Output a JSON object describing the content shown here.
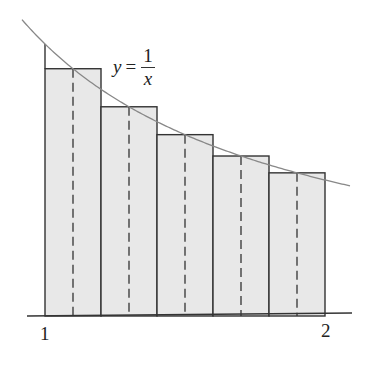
{
  "figure": {
    "equation": {
      "lhs": "y",
      "eq": "=",
      "numerator": "1",
      "denominator": "x"
    },
    "axis_labels": {
      "left": "1",
      "right": "2"
    },
    "colors": {
      "fill": "#e8e8e8",
      "stroke": "#333333",
      "curve": "#888888"
    }
  },
  "chart_data": {
    "type": "diagram",
    "function": "y = 1/x",
    "interval": [
      1,
      2
    ],
    "n": 5,
    "rectangles": [
      {
        "left": 1.0,
        "right": 1.2,
        "midpoint": 1.1,
        "height": 0.9091
      },
      {
        "left": 1.2,
        "right": 1.4,
        "midpoint": 1.3,
        "height": 0.7692
      },
      {
        "left": 1.4,
        "right": 1.6,
        "midpoint": 1.5,
        "height": 0.6667
      },
      {
        "left": 1.6,
        "right": 1.8,
        "midpoint": 1.7,
        "height": 0.5882
      },
      {
        "left": 1.8,
        "right": 2.0,
        "midpoint": 1.9,
        "height": 0.5263
      }
    ],
    "x_ticks": [
      "1",
      "2"
    ],
    "dashed_midpoint_lines": true
  }
}
